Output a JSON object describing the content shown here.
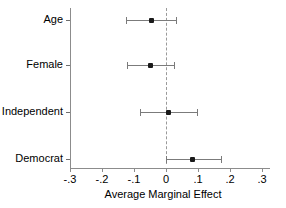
{
  "chart_data": {
    "type": "scatter",
    "subtype": "coefficient-forest-plot",
    "title": "",
    "xlabel": "Average Marginal Effect",
    "ylabel": "",
    "orientation": "horizontal",
    "grid": false,
    "legend": null,
    "xlim": [
      -0.3,
      0.3
    ],
    "xticks": [
      -0.3,
      -0.2,
      -0.1,
      0,
      0.1,
      0.2,
      0.3
    ],
    "xticklabels": [
      "-.3",
      "-.2",
      "-.1",
      "0",
      ".1",
      ".2",
      ".3"
    ],
    "reference_line": {
      "value": 0,
      "style": "dashed",
      "color": "#9a9a9a"
    },
    "categories": [
      "Age",
      "Female",
      "Independent",
      "Democrat"
    ],
    "points": [
      {
        "label": "Age",
        "estimate": -0.045,
        "ci_low": -0.125,
        "ci_high": 0.031
      },
      {
        "label": "Female",
        "estimate": -0.048,
        "ci_low": -0.123,
        "ci_high": 0.025
      },
      {
        "label": "Independent",
        "estimate": 0.008,
        "ci_low": -0.081,
        "ci_high": 0.097
      },
      {
        "label": "Democrat",
        "estimate": 0.084,
        "ci_low": 0.0,
        "ci_high": 0.172
      }
    ],
    "marker_color": "#1a1a1a",
    "interval_color": "#7b7b7b",
    "axis_color": "#8c8c8c"
  }
}
